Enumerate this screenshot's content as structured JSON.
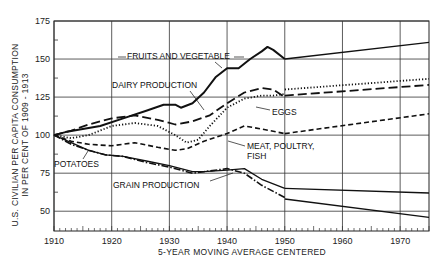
{
  "chart_data": {
    "type": "line",
    "title": "",
    "xlabel": "5-YEAR MOVING AVERAGE CENTERED",
    "ylabel_lines": [
      "U.S. CIVILIAN PER CAPITA CONSUMPTION",
      "IN PER CENT OF 1909 - 1913"
    ],
    "xlim": [
      1910,
      1975
    ],
    "ylim": [
      37,
      175
    ],
    "x_ticks": [
      1910,
      1920,
      1930,
      1940,
      1950,
      1960,
      1970
    ],
    "y_ticks": [
      50,
      75,
      100,
      125,
      150,
      175
    ],
    "grid": true,
    "series": [
      {
        "name": "FRUITS AND VEGETABLE",
        "style": "solid-thick",
        "x": [
          1910,
          1912,
          1915,
          1918,
          1922,
          1926,
          1929,
          1931,
          1932,
          1934,
          1936,
          1938,
          1940,
          1942,
          1944,
          1946,
          1947,
          1948,
          1950
        ],
        "y": [
          100,
          102,
          104,
          106,
          111,
          116,
          120,
          120,
          118,
          121,
          128,
          138,
          144,
          144,
          150,
          155,
          158,
          156,
          150
        ]
      },
      {
        "name": "DAIRY PRODUCTION",
        "style": "long-dash",
        "x": [
          1910,
          1913,
          1916,
          1920,
          1924,
          1928,
          1931,
          1934,
          1937,
          1940,
          1943,
          1946,
          1948,
          1950
        ],
        "y": [
          100,
          103,
          107,
          111,
          113,
          110,
          107,
          109,
          113,
          121,
          128,
          131,
          130,
          125
        ]
      },
      {
        "name": "EGGS",
        "style": "dotted",
        "x": [
          1910,
          1913,
          1916,
          1920,
          1924,
          1928,
          1931,
          1933,
          1935,
          1937,
          1940,
          1943,
          1946,
          1948,
          1950
        ],
        "y": [
          100,
          98,
          100,
          106,
          108,
          106,
          100,
          95,
          97,
          106,
          118,
          124,
          126,
          126,
          127
        ]
      },
      {
        "name": "MEAT, POULTRY, FISH",
        "style": "short-dash",
        "x": [
          1910,
          1913,
          1916,
          1920,
          1924,
          1928,
          1931,
          1933,
          1936,
          1940,
          1943,
          1946,
          1950
        ],
        "y": [
          100,
          96,
          94,
          93,
          95,
          92,
          90,
          91,
          96,
          101,
          106,
          104,
          101
        ]
      },
      {
        "name": "POTATOES",
        "style": "solid",
        "x": [
          1910,
          1913,
          1916,
          1919,
          1922,
          1926,
          1930,
          1934,
          1936,
          1940,
          1943,
          1946,
          1950
        ],
        "y": [
          100,
          95,
          90,
          87,
          86,
          83,
          80,
          76,
          76,
          77,
          78,
          71,
          65
        ]
      },
      {
        "name": "GRAIN PRODUCTION",
        "style": "dash-dot",
        "x": [
          1910,
          1913,
          1916,
          1919,
          1922,
          1926,
          1930,
          1934,
          1936,
          1940,
          1943,
          1946,
          1950
        ],
        "y": [
          100,
          94,
          90,
          87,
          86,
          82,
          79,
          75,
          76,
          78,
          75,
          67,
          59
        ]
      }
    ],
    "projections": [
      {
        "name": "FRUITS AND VEGETABLE",
        "style": "solid",
        "x": [
          1950,
          1975
        ],
        "y": [
          150,
          161
        ]
      },
      {
        "name": "EGGS",
        "style": "dotted",
        "x": [
          1950,
          1975
        ],
        "y": [
          130,
          137
        ]
      },
      {
        "name": "DAIRY PRODUCTION",
        "style": "long-dash",
        "x": [
          1950,
          1975
        ],
        "y": [
          126,
          133
        ]
      },
      {
        "name": "MEAT, POULTRY, FISH",
        "style": "short-dash",
        "x": [
          1950,
          1975
        ],
        "y": [
          101,
          114
        ]
      },
      {
        "name": "POTATOES",
        "style": "solid",
        "x": [
          1950,
          1975
        ],
        "y": [
          65,
          62
        ]
      },
      {
        "name": "GRAIN PRODUCTION",
        "style": "solid",
        "x": [
          1950,
          1975
        ],
        "y": [
          58,
          46
        ]
      }
    ],
    "annotations": [
      {
        "text": "FRUITS AND VEGETABLE",
        "series": "FRUITS AND VEGETABLE"
      },
      {
        "text": "DAIRY PRODUCTION",
        "series": "DAIRY PRODUCTION"
      },
      {
        "text": "EGGS",
        "series": "EGGS"
      },
      {
        "text": "MEAT, POULTRY,",
        "series": "MEAT, POULTRY, FISH"
      },
      {
        "text": "FISH",
        "series": "MEAT, POULTRY, FISH"
      },
      {
        "text": "POTATOES",
        "series": "POTATOES"
      },
      {
        "text": "GRAIN PRODUCTION",
        "series": "GRAIN PRODUCTION"
      }
    ]
  }
}
